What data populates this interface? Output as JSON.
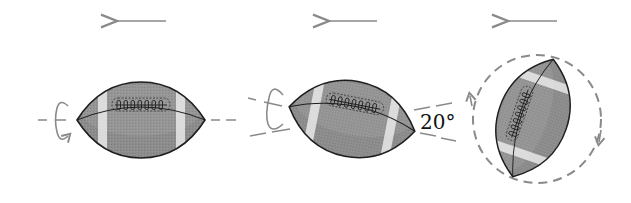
{
  "figure": {
    "colors": {
      "ball_fill": "#8c8c8c",
      "ball_fill_light": "#a5a5a5",
      "stripe": "#e2e2e2",
      "outline": "#1e1e1e",
      "guide": "#8a8a8a"
    },
    "panels": [
      {
        "id": "panel-1",
        "label": "spiral aligned with velocity",
        "arrow": "motion-left"
      },
      {
        "id": "panel-2",
        "label": "axis tilted 20 degrees",
        "arrow": "motion-left",
        "angle_label": "20°"
      },
      {
        "id": "panel-3",
        "label": "ball tumbling end over end",
        "arrow": "motion-left"
      }
    ]
  }
}
